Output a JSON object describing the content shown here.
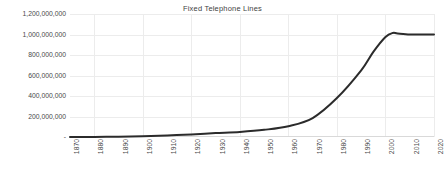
{
  "chart_data": {
    "type": "line",
    "title": "Fixed Telephone Lines",
    "xlabel": "",
    "ylabel": "",
    "xlim": [
      1870,
      2020
    ],
    "ylim": [
      0,
      1200000000
    ],
    "grid": true,
    "legend": false,
    "y_ticks": [
      0,
      200000000,
      400000000,
      600000000,
      800000000,
      1000000000,
      1200000000
    ],
    "y_tick_labels": [
      "-",
      "200,000,000",
      "400,000,000",
      "600,000,000",
      "800,000,000",
      "1,000,000,000",
      "1,200,000,000"
    ],
    "x_ticks": [
      1870,
      1880,
      1890,
      1900,
      1910,
      1920,
      1930,
      1940,
      1950,
      1960,
      1970,
      1980,
      1990,
      2000,
      2010,
      2020
    ],
    "x_tick_labels": [
      "1870",
      "1880",
      "1890",
      "1900",
      "1910",
      "1920",
      "1930",
      "1940",
      "1950",
      "1960",
      "1970",
      "1980",
      "1990",
      "2000",
      "2010",
      "2020"
    ],
    "series": [
      {
        "name": "Fixed Telephone Lines",
        "color": "#2b2b2b",
        "x": [
          1870,
          1880,
          1890,
          1900,
          1910,
          1920,
          1930,
          1940,
          1950,
          1960,
          1970,
          1980,
          1990,
          1995,
          2000,
          2003,
          2005,
          2010,
          2015,
          2020
        ],
        "values": [
          0,
          1000000,
          3000000,
          8000000,
          15000000,
          25000000,
          38000000,
          50000000,
          70000000,
          105000000,
          185000000,
          380000000,
          650000000,
          830000000,
          975000000,
          1015000000,
          1010000000,
          1000000000,
          1000000000,
          1000000000
        ]
      }
    ]
  }
}
